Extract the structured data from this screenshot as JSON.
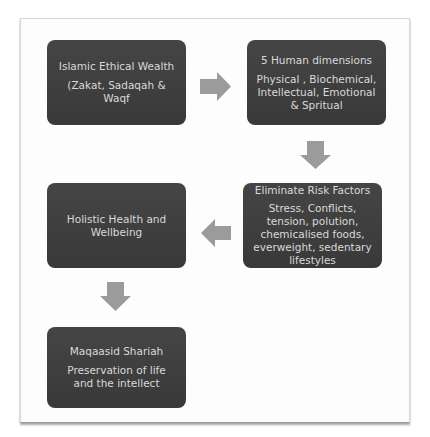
{
  "diagram": {
    "type": "flowchart",
    "colors": {
      "box_fill": "#3f3f3f",
      "box_text": "#d9d9d9",
      "arrow_fill": "#9b9b9b",
      "frame_border": "#d6d6d6"
    },
    "nodes": [
      {
        "id": "islamic-ethical-wealth",
        "title": "Islamic Ethical Wealth",
        "body": "(Zakat, Sadaqah & Waqf"
      },
      {
        "id": "human-dimensions",
        "title": "5 Human dimensions",
        "body": "Physical , Biochemical, Intellectual, Emotional & Spritual"
      },
      {
        "id": "eliminate-risk-factors",
        "title": "Eliminate Risk Factors",
        "body": "Stress, Conflicts, tension, polution, chemicalised foods, everweight, sedentary lifestyles"
      },
      {
        "id": "holistic-health",
        "title": "Holistic Health and Wellbeing",
        "body": ""
      },
      {
        "id": "maqaasid-shariah",
        "title": "Maqaasid Shariah",
        "body": "Preservation of life and the intellect"
      }
    ],
    "edges": [
      {
        "from": "islamic-ethical-wealth",
        "to": "human-dimensions",
        "direction": "right",
        "icon": "arrow-right-icon"
      },
      {
        "from": "human-dimensions",
        "to": "eliminate-risk-factors",
        "direction": "down",
        "icon": "arrow-down-icon"
      },
      {
        "from": "eliminate-risk-factors",
        "to": "holistic-health",
        "direction": "left",
        "icon": "arrow-left-icon"
      },
      {
        "from": "holistic-health",
        "to": "maqaasid-shariah",
        "direction": "down",
        "icon": "arrow-down-icon"
      }
    ]
  }
}
